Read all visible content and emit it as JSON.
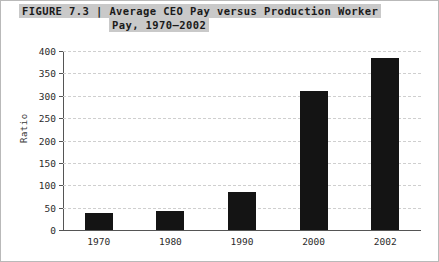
{
  "caption": {
    "line1": "FIGURE 7.3 | Average CEO Pay versus Production Worker",
    "line2": "Pay, 1970–2002"
  },
  "colors": {
    "bar": "#141414",
    "banner": "#c9c9c9",
    "grid": "#cfcfcf",
    "axis": "#555555",
    "frame": "#b9b9b9",
    "background": "#ffffff"
  },
  "chart_data": {
    "type": "bar",
    "title": "FIGURE 7.3 | Average CEO Pay versus Production Worker Pay, 1970–2002",
    "categories": [
      "1970",
      "1980",
      "1990",
      "2000",
      "2002"
    ],
    "values": [
      39,
      42,
      85,
      310,
      385
    ],
    "xlabel": "",
    "ylabel": "Ratio",
    "ylim": [
      0,
      400
    ],
    "yticks": [
      0,
      50,
      100,
      150,
      200,
      250,
      300,
      350,
      400
    ],
    "ytick_labels": [
      "0",
      "50",
      "100",
      "150",
      "200",
      "250",
      "300",
      "350",
      "400"
    ],
    "grid": true,
    "grid_axis": "y",
    "grid_style": "dashed",
    "legend": false,
    "series": [
      {
        "name": "Ratio of CEO pay to production worker pay",
        "values": [
          39,
          42,
          85,
          310,
          385
        ]
      }
    ]
  }
}
